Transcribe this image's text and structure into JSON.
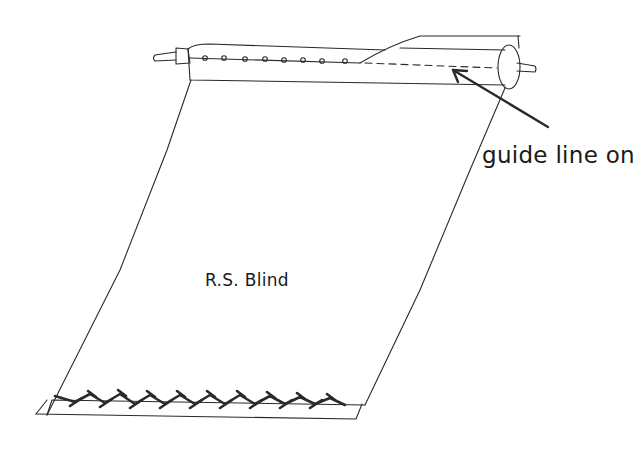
{
  "figure": {
    "labels": {
      "guide_line": "guide line on",
      "blind": "R.S. Blind"
    },
    "parts": [
      "roller",
      "left-pin",
      "right-pin",
      "tack-holes",
      "dashed-guide-line",
      "arrow",
      "blind-fabric",
      "bottom-hem",
      "zigzag-stitching"
    ],
    "colors": {
      "ink": "#2a2a2a",
      "background": "#ffffff"
    },
    "tack_hole_count": 8,
    "stitch_cross_count": 14
  }
}
